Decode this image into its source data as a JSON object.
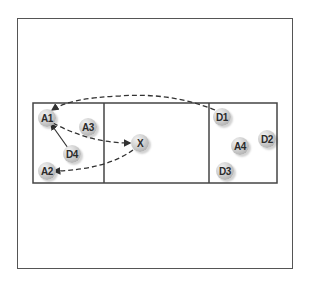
{
  "diagram": {
    "type": "sports-drill",
    "zones": [
      "left-zone",
      "middle-zone",
      "right-zone"
    ],
    "players": [
      {
        "id": "A1",
        "label": "A1",
        "x": 47,
        "y": 118
      },
      {
        "id": "A3",
        "label": "A3",
        "x": 88,
        "y": 127
      },
      {
        "id": "D4",
        "label": "D4",
        "x": 72,
        "y": 154
      },
      {
        "id": "A2",
        "label": "A2",
        "x": 47,
        "y": 171
      },
      {
        "id": "X",
        "label": "X",
        "x": 140,
        "y": 143
      },
      {
        "id": "D1",
        "label": "D1",
        "x": 222,
        "y": 117
      },
      {
        "id": "A4",
        "label": "A4",
        "x": 240,
        "y": 146
      },
      {
        "id": "D2",
        "label": "D2",
        "x": 267,
        "y": 139
      },
      {
        "id": "D3",
        "label": "D3",
        "x": 225,
        "y": 171
      }
    ],
    "arrows": [
      {
        "from": "D4",
        "to": "A1",
        "style": "solid"
      },
      {
        "from": "A1",
        "to": "X",
        "style": "dashed"
      },
      {
        "from": "X",
        "to": "A2",
        "style": "dashed"
      },
      {
        "from": "D1",
        "to": "A1",
        "style": "dashed"
      }
    ],
    "colors": {
      "line": "#333333",
      "border": "#555555"
    }
  }
}
